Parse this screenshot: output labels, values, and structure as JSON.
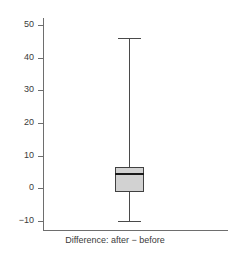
{
  "chart_data": {
    "type": "box",
    "title": "",
    "subtitle": "",
    "xlabel": "Difference: after − before",
    "ylabel": "",
    "categories": [
      "Difference: after − before"
    ],
    "ylim": [
      -13,
      53
    ],
    "yticks": [
      -10,
      0,
      10,
      20,
      30,
      40,
      50
    ],
    "ytick_labels": [
      "−10",
      "0",
      "10",
      "20",
      "30",
      "40",
      "50"
    ],
    "grid": false,
    "legend": null,
    "boxes": [
      {
        "label": "Difference: after − before",
        "whisker_low": -10,
        "q1": -1,
        "median": 4.7,
        "q3": 6.4,
        "whisker_high": 46,
        "outliers": [],
        "box_fill": "#d2d2d2",
        "box_stroke": "#404040",
        "median_color": "#1a1a1a",
        "whisker_color": "#4a4a4a"
      }
    ],
    "colors": {
      "background": "#ffffff",
      "axis": "#6e6e6e",
      "text": "#3b3b3b"
    }
  },
  "axis": {
    "ticks": [
      {
        "label": "50",
        "value": 50
      },
      {
        "label": "40",
        "value": 40
      },
      {
        "label": "30",
        "value": 30
      },
      {
        "label": "20",
        "value": 20
      },
      {
        "label": "10",
        "value": 10
      },
      {
        "label": "0",
        "value": 0
      },
      {
        "label": "−10",
        "value": -10
      }
    ]
  },
  "footer": {
    "x_label": "Difference: after − before"
  }
}
